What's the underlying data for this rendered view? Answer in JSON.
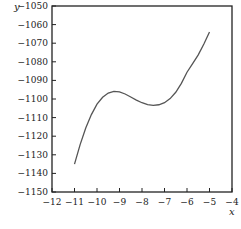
{
  "chart_data": {
    "type": "line",
    "title": "",
    "xlabel": "x",
    "ylabel": "y",
    "xlim": [
      -12,
      -4
    ],
    "ylim": [
      -1150,
      -1050
    ],
    "grid": false,
    "legend": null,
    "x_ticks": [
      -12,
      -11,
      -10,
      -9,
      -8,
      -7,
      -6,
      -5,
      -4
    ],
    "x_tick_labels": [
      "−12",
      "−11",
      "−10",
      "−9",
      "−8",
      "−7",
      "−6",
      "−5",
      "−4"
    ],
    "y_ticks": [
      -1050,
      -1060,
      -1070,
      -1080,
      -1090,
      -1100,
      -1110,
      -1120,
      -1130,
      -1140,
      -1150
    ],
    "y_tick_labels": [
      "−1050",
      "−1060",
      "−1070",
      "−1080",
      "−1090",
      "−1100",
      "−1110",
      "−1120",
      "−1130",
      "−1140",
      "−1150"
    ],
    "series": [
      {
        "name": "curve",
        "color": "#555555",
        "x": [
          -11,
          -10.75,
          -10.5,
          -10.25,
          -10,
          -9.75,
          -9.5,
          -9.25,
          -9,
          -8.75,
          -8.5,
          -8.25,
          -8,
          -7.75,
          -7.5,
          -7.25,
          -7,
          -6.75,
          -6.5,
          -6.25,
          -6,
          -5.75,
          -5.5,
          -5.25,
          -5
        ],
        "y": [
          -1135,
          -1124.5,
          -1115.6,
          -1108.4,
          -1102.8,
          -1099.1,
          -1096.8,
          -1095.9,
          -1096.2,
          -1097.3,
          -1098.9,
          -1100.6,
          -1102.0,
          -1103.0,
          -1103.4,
          -1103.1,
          -1102.0,
          -1099.8,
          -1096.4,
          -1091.6,
          -1085.6,
          -1081.0,
          -1076.3,
          -1070.4,
          -1064
        ]
      }
    ]
  }
}
